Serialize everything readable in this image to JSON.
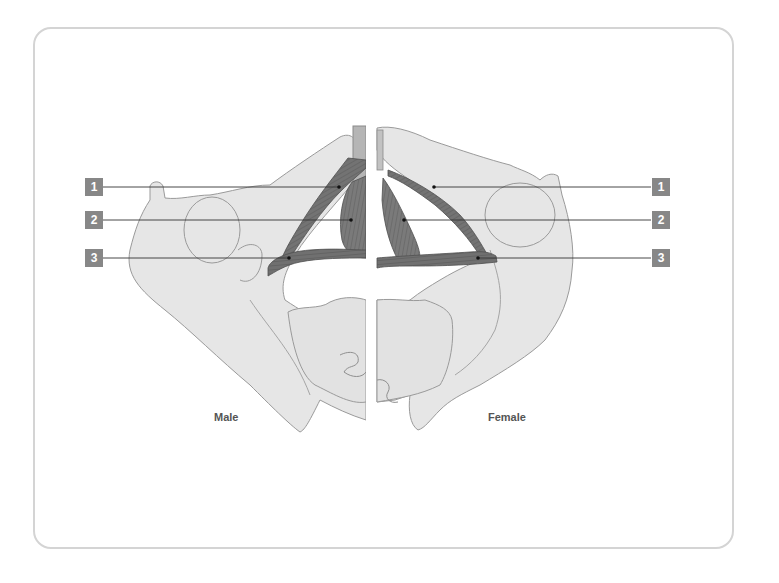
{
  "diagram": {
    "captions": {
      "left": "Male",
      "right": "Female"
    },
    "labels": [
      {
        "id": "1",
        "text": "1",
        "y": 187,
        "male_target_x": 339,
        "female_target_x": 434
      },
      {
        "id": "2",
        "text": "2",
        "y": 220,
        "male_target_x": 351,
        "female_target_x": 404
      },
      {
        "id": "3",
        "text": "3",
        "y": 258,
        "male_target_x": 289,
        "female_target_x": 478
      }
    ],
    "colors": {
      "frame_border": "#d4d4d4",
      "bone_fill": "#e6e6e6",
      "bone_stroke": "#9a9a9a",
      "muscle_fill": "#6e6e6e",
      "label_box": "#878787",
      "label_text": "#ffffff",
      "leader_line": "#333333"
    }
  }
}
